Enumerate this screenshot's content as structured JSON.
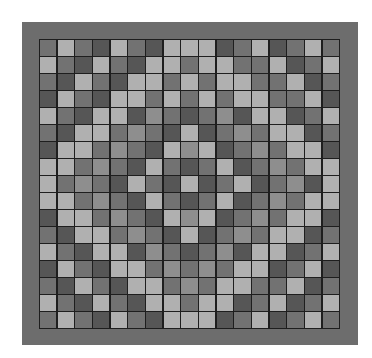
{
  "palette": [
    "#565656",
    "#727272",
    "#8e8e8e",
    "#b0b0b0"
  ],
  "frame_color": "#6d6d6d",
  "grid": {
    "rows": 17,
    "cols": 17,
    "cells": [
      [
        1,
        3,
        1,
        0,
        3,
        1,
        0,
        3,
        3,
        3,
        0,
        1,
        3,
        0,
        1,
        3,
        1
      ],
      [
        3,
        1,
        0,
        3,
        1,
        0,
        3,
        3,
        1,
        3,
        3,
        1,
        1,
        3,
        0,
        1,
        3
      ],
      [
        1,
        0,
        3,
        1,
        0,
        3,
        3,
        1,
        3,
        1,
        3,
        3,
        1,
        1,
        3,
        0,
        1
      ],
      [
        0,
        3,
        1,
        0,
        3,
        3,
        1,
        3,
        1,
        3,
        1,
        3,
        3,
        1,
        1,
        3,
        0
      ],
      [
        3,
        1,
        0,
        3,
        3,
        0,
        2,
        1,
        0,
        1,
        2,
        0,
        3,
        3,
        0,
        1,
        3
      ],
      [
        1,
        0,
        3,
        3,
        1,
        2,
        1,
        0,
        3,
        0,
        1,
        2,
        1,
        3,
        3,
        0,
        1
      ],
      [
        0,
        3,
        3,
        1,
        2,
        1,
        0,
        3,
        2,
        3,
        0,
        1,
        2,
        1,
        3,
        3,
        0
      ],
      [
        3,
        3,
        1,
        2,
        1,
        0,
        3,
        1,
        0,
        1,
        3,
        0,
        1,
        2,
        1,
        3,
        3
      ],
      [
        3,
        1,
        2,
        1,
        0,
        3,
        1,
        0,
        3,
        0,
        1,
        3,
        0,
        1,
        2,
        0,
        3
      ],
      [
        3,
        3,
        1,
        2,
        1,
        0,
        3,
        1,
        0,
        1,
        3,
        0,
        1,
        2,
        1,
        3,
        3
      ],
      [
        0,
        3,
        3,
        1,
        2,
        1,
        0,
        3,
        2,
        3,
        0,
        1,
        2,
        1,
        3,
        3,
        0
      ],
      [
        1,
        0,
        3,
        3,
        1,
        2,
        1,
        0,
        3,
        0,
        1,
        2,
        1,
        3,
        3,
        0,
        1
      ],
      [
        3,
        1,
        0,
        3,
        3,
        0,
        2,
        1,
        0,
        1,
        2,
        0,
        3,
        3,
        0,
        1,
        3
      ],
      [
        0,
        3,
        1,
        0,
        3,
        3,
        1,
        2,
        1,
        2,
        1,
        3,
        3,
        0,
        1,
        3,
        0
      ],
      [
        1,
        0,
        3,
        1,
        0,
        3,
        3,
        1,
        2,
        1,
        3,
        3,
        1,
        1,
        3,
        0,
        1
      ],
      [
        3,
        1,
        0,
        3,
        1,
        0,
        3,
        3,
        1,
        3,
        3,
        0,
        1,
        3,
        0,
        1,
        3
      ],
      [
        1,
        3,
        1,
        0,
        3,
        1,
        0,
        3,
        3,
        3,
        0,
        1,
        3,
        0,
        1,
        3,
        1
      ]
    ]
  }
}
